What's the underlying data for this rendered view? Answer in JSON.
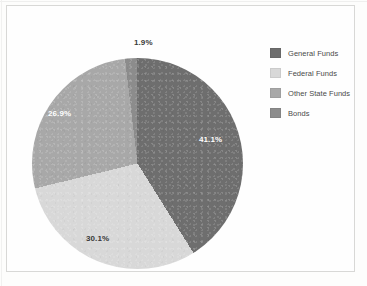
{
  "figure": {
    "background_color": "#fefefe",
    "frame_color": "#d8d8d6"
  },
  "chart_data": {
    "type": "pie",
    "title": "",
    "subtitle": "",
    "xlabel": "",
    "ylabel": "",
    "grid": false,
    "legend_position": "right",
    "start_angle_deg": 0,
    "direction": "clockwise",
    "labels_show_percent": true,
    "categories": [
      "General Funds",
      "Federal Funds",
      "Other State Funds",
      "Bonds"
    ],
    "values": [
      41.1,
      30.1,
      26.9,
      1.9
    ],
    "value_labels": [
      "41.1%",
      "30.1%",
      "26.9%",
      "1.9%"
    ],
    "colors": [
      "#6e6e6e",
      "#d8d8d8",
      "#a8a8a8",
      "#8c8c8c"
    ],
    "total": 100.0,
    "units": "percent"
  },
  "legend": {
    "items": [
      {
        "label": "General Funds",
        "color": "#6e6e6e",
        "value_label": "41.1%"
      },
      {
        "label": "Federal Funds",
        "color": "#d8d8d8",
        "value_label": "30.1%"
      },
      {
        "label": "Other State Funds",
        "color": "#a8a8a8",
        "value_label": "26.9%"
      },
      {
        "label": "Bonds",
        "color": "#8c8c8c",
        "value_label": "1.9%"
      }
    ]
  },
  "slice_labels": {
    "general": "41.1%",
    "federal": "30.1%",
    "other_state": "26.9%",
    "bonds": "1.9%"
  }
}
